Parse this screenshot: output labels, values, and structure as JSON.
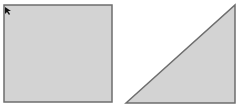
{
  "canvas": {
    "width": 240,
    "height": 109,
    "background": "#ffffff"
  },
  "shapes": [
    {
      "type": "square",
      "x": 4,
      "y": 5,
      "width": 108,
      "height": 97,
      "fill": "#d3d3d3",
      "stroke": "#6e6e6e",
      "selected_corner_marker": {
        "x": 5,
        "y": 7
      }
    },
    {
      "type": "right-triangle",
      "points": [
        [
          126,
          103
        ],
        [
          235,
          5
        ],
        [
          235,
          103
        ]
      ],
      "fill": "#d3d3d3",
      "stroke": "#6e6e6e"
    }
  ],
  "icons": {
    "cursor": "mouse-pointer-icon"
  }
}
